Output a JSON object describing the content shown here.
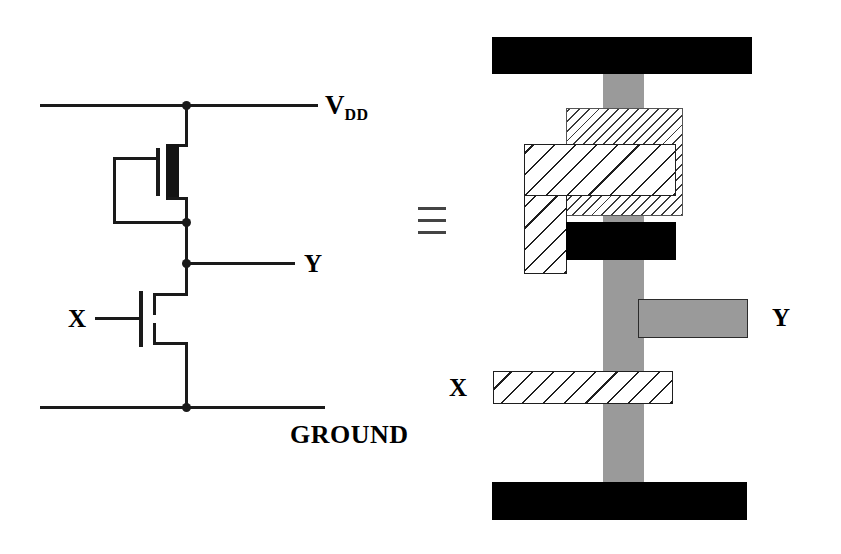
{
  "figure": {
    "equivalence_symbol": "≡"
  },
  "schematic": {
    "labels": {
      "vdd_main": "V",
      "vdd_subscript": "DD",
      "ground": "GROUND",
      "input": "X",
      "output": "Y"
    },
    "devices": [
      {
        "name": "pull-up-load",
        "type": "depletion-mode nMOS",
        "symbol": "solid-channel",
        "gate_connection": "source (self-biased load)"
      },
      {
        "name": "pull-down-driver",
        "type": "enhancement-mode nMOS",
        "symbol": "broken-channel",
        "gate_connection": "X"
      }
    ],
    "rails": [
      {
        "name": "vdd-rail",
        "label": "V DD"
      },
      {
        "name": "ground-rail",
        "label": "GROUND"
      }
    ]
  },
  "layout": {
    "labels": {
      "input": "X",
      "output": "Y"
    },
    "layers": [
      {
        "name": "metal",
        "color": "#000000",
        "fill": "solid-black",
        "role": "metal / power rails"
      },
      {
        "name": "diffusion",
        "color": "#9a9a9a",
        "fill": "gray-stipple",
        "role": "diffusion (active)"
      },
      {
        "name": "polysilicon",
        "color": "#ffffff",
        "fill": "diagonal-hatch",
        "role": "polysilicon gate"
      },
      {
        "name": "implant",
        "color": "#ffffff",
        "fill": "sparse-dashes",
        "role": "depletion implant"
      }
    ],
    "shapes": [
      {
        "name": "vdd-metal-rail",
        "layer": "metal"
      },
      {
        "name": "ground-metal-rail",
        "layer": "metal"
      },
      {
        "name": "diffusion-column",
        "layer": "diffusion"
      },
      {
        "name": "y-output-tab",
        "layer": "diffusion"
      },
      {
        "name": "depletion-implant",
        "layer": "implant"
      },
      {
        "name": "load-gate-poly",
        "layer": "polysilicon"
      },
      {
        "name": "driver-gate-poly-x",
        "layer": "polysilicon"
      },
      {
        "name": "gate-source-contact",
        "layer": "metal"
      }
    ]
  },
  "colors": {
    "ink": "#1a1a1a",
    "metal": "#000000",
    "diffusion": "#9a9a9a",
    "hatch_line": "#1f1f1f",
    "implant_line": "#3a3a3a",
    "background": "#ffffff"
  }
}
